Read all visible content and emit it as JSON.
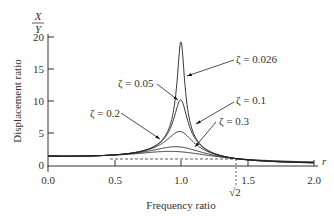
{
  "chart_data": {
    "type": "line",
    "title": "",
    "xlabel": "Frequency ratio",
    "ylabel": "Displacement ratio",
    "y_axis_fraction": {
      "numerator": "X",
      "denominator": "Y"
    },
    "x_axis_symbol": "r",
    "xlim": [
      0.0,
      2.0
    ],
    "ylim": [
      0,
      20
    ],
    "x_ticks": [
      "0.0",
      "0.5",
      "1.0",
      "1.5",
      "2.0"
    ],
    "y_ticks": [
      "0",
      "5",
      "10",
      "15",
      "20"
    ],
    "special_tick": {
      "label": "√2",
      "value": 1.414
    },
    "reference_line": {
      "y": 1,
      "style": "dashed"
    },
    "grid": false,
    "series": [
      {
        "name": "ζ = 0.026",
        "zeta": 0.026
      },
      {
        "name": "ζ = 0.05",
        "zeta": 0.05
      },
      {
        "name": "ζ = 0.1",
        "zeta": 0.1
      },
      {
        "name": "ζ = 0.2",
        "zeta": 0.2
      },
      {
        "name": "ζ = 0.3",
        "zeta": 0.3
      }
    ],
    "annotations": [
      {
        "text": "ζ = 0.026",
        "x": 1.33,
        "y": 17.0
      },
      {
        "text": "ζ = 0.05",
        "x": 0.62,
        "y": 13.0
      },
      {
        "text": "ζ = 0.1",
        "x": 1.33,
        "y": 9.8
      },
      {
        "text": "ζ = 0.2",
        "x": 0.55,
        "y": 7.5
      },
      {
        "text": "ζ = 0.3",
        "x": 1.45,
        "y": 7.2
      }
    ]
  },
  "labels": {
    "y_num": "X",
    "y_den": "Y",
    "ylabel": "Displacement ratio",
    "xlabel": "Frequency ratio",
    "r": "r",
    "sqrt2": "√2",
    "x0": "0.0",
    "x1": "0.5",
    "x2": "1.0",
    "x3": "1.5",
    "x4": "2.0",
    "y0": "0",
    "y1": "5",
    "y2": "10",
    "y3": "15",
    "y4": "20",
    "z026": "ζ = 0.026",
    "z05": "ζ = 0.05",
    "z1": "ζ = 0.1",
    "z2": "ζ = 0.2",
    "z3": "ζ = 0.3"
  }
}
